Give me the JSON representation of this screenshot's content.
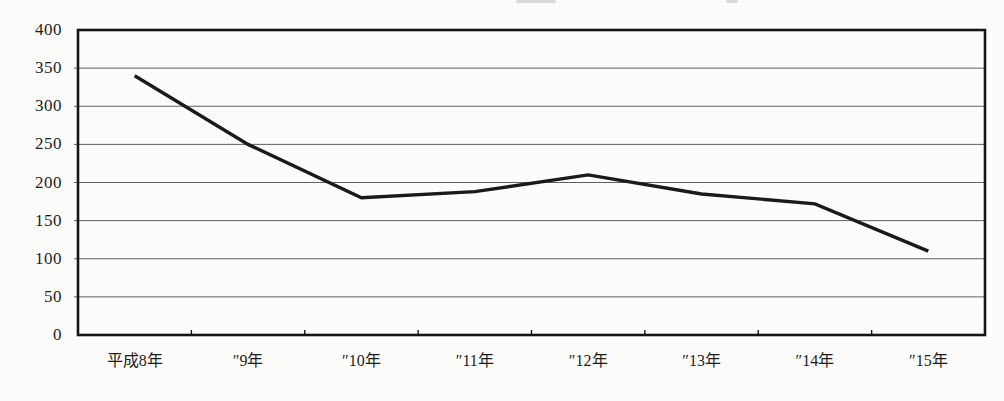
{
  "figure": {
    "background": "#fcfcfa",
    "text_color": "#1c1c1c"
  },
  "chart_data": {
    "type": "line",
    "title": "",
    "categories": [
      "平成8年",
      "″9年",
      "″10年",
      "″11年",
      "″12年",
      "″13年",
      "″14年",
      "″15年"
    ],
    "values": [
      340,
      250,
      180,
      188,
      210,
      185,
      172,
      110
    ],
    "xlabel": "",
    "ylabel": "",
    "ylim": [
      0,
      400
    ],
    "ytick_step": 50,
    "y_tick_labels": [
      "0",
      "50",
      "100",
      "150",
      "200",
      "250",
      "300",
      "350",
      "400"
    ],
    "grid": "horizontal",
    "legend": "none",
    "line_color": "#1a1a1a",
    "line_width": 3.4,
    "grid_color": "#606060",
    "border_color": "#161616"
  }
}
